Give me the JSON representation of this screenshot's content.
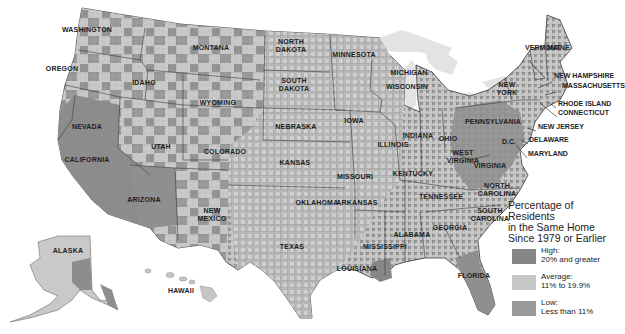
{
  "map": {
    "title": "Percentage of Residents in the Same Home Since 1979 or Earlier",
    "colors": {
      "high": "#8a8a8a",
      "average": "#c9c9c9",
      "low": "#9b9b9b",
      "border": "#3a3a3a",
      "water": "#e4e4e4",
      "background": "#ffffff"
    },
    "states": [
      {
        "name": "WASHINGTON",
        "x": 87,
        "y": 30
      },
      {
        "name": "OREGON",
        "x": 62,
        "y": 69
      },
      {
        "name": "IDAHO",
        "x": 144,
        "y": 83
      },
      {
        "name": "MONTANA",
        "x": 211,
        "y": 48
      },
      {
        "name": "WYOMING",
        "x": 218,
        "y": 103
      },
      {
        "name": "NORTH\nDAKOTA",
        "x": 291,
        "y": 46
      },
      {
        "name": "SOUTH\nDAKOTA",
        "x": 294,
        "y": 85
      },
      {
        "name": "MINNESOTA",
        "x": 354,
        "y": 55
      },
      {
        "name": "WISCONSIN",
        "x": 407,
        "y": 87
      },
      {
        "name": "MICHIGAN",
        "x": 409,
        "y": 73
      },
      {
        "name": "NEBRASKA",
        "x": 296,
        "y": 127
      },
      {
        "name": "IOWA",
        "x": 354,
        "y": 121
      },
      {
        "name": "ILLINOIS",
        "x": 393,
        "y": 145
      },
      {
        "name": "INDIANA",
        "x": 418,
        "y": 136
      },
      {
        "name": "OHIO",
        "x": 448,
        "y": 139
      },
      {
        "name": "NEVADA",
        "x": 87,
        "y": 127
      },
      {
        "name": "UTAH",
        "x": 161,
        "y": 147
      },
      {
        "name": "COLORADO",
        "x": 225,
        "y": 152
      },
      {
        "name": "KANSAS",
        "x": 295,
        "y": 163
      },
      {
        "name": "MISSOURI",
        "x": 355,
        "y": 177
      },
      {
        "name": "KENTUCKY",
        "x": 413,
        "y": 174
      },
      {
        "name": "WEST\nVIRGINIA",
        "x": 463,
        "y": 157
      },
      {
        "name": "VIRGINIA",
        "x": 490,
        "y": 166
      },
      {
        "name": "PENNSYLVANIA",
        "x": 493,
        "y": 122
      },
      {
        "name": "NEW\nYORK",
        "x": 507,
        "y": 89
      },
      {
        "name": "CALIFORNIA",
        "x": 87,
        "y": 160
      },
      {
        "name": "ARIZONA",
        "x": 144,
        "y": 200
      },
      {
        "name": "NEW\nMEXICO",
        "x": 212,
        "y": 215
      },
      {
        "name": "OKLAHOMA",
        "x": 317,
        "y": 203
      },
      {
        "name": "ARKANSAS",
        "x": 357,
        "y": 203
      },
      {
        "name": "TENNESSEE",
        "x": 441,
        "y": 197
      },
      {
        "name": "NORTH\nCAROLINA",
        "x": 497,
        "y": 190
      },
      {
        "name": "SOUTH\nCAROLINA",
        "x": 490,
        "y": 215
      },
      {
        "name": "GEORGIA",
        "x": 450,
        "y": 228
      },
      {
        "name": "ALABAMA",
        "x": 412,
        "y": 235
      },
      {
        "name": "MISSISSIPPI",
        "x": 385,
        "y": 247
      },
      {
        "name": "LOUISIANA",
        "x": 357,
        "y": 269
      },
      {
        "name": "TEXAS",
        "x": 292,
        "y": 247
      },
      {
        "name": "FLORIDA",
        "x": 474,
        "y": 276
      },
      {
        "name": "ALASKA",
        "x": 68,
        "y": 251
      },
      {
        "name": "HAWAII",
        "x": 181,
        "y": 291
      }
    ],
    "callouts": [
      {
        "name": "VERMONT",
        "x": 525,
        "y": 48
      },
      {
        "name": "MAINE",
        "x": 547,
        "y": 48
      },
      {
        "name": "NEW HAMPSHIRE",
        "x": 554,
        "y": 76
      },
      {
        "name": "MASSACHUSETTS",
        "x": 562,
        "y": 86
      },
      {
        "name": "RHODE ISLAND",
        "x": 558,
        "y": 104
      },
      {
        "name": "CONNECTICUT",
        "x": 558,
        "y": 113
      },
      {
        "name": "NEW JERSEY",
        "x": 538,
        "y": 127
      },
      {
        "name": "DELAWARE",
        "x": 529,
        "y": 140
      },
      {
        "name": "MARYLAND",
        "x": 528,
        "y": 154
      },
      {
        "name": "D.C.",
        "x": 502,
        "y": 142
      }
    ]
  },
  "legend": {
    "title": "Percentage of Residents in the Same Home Since 1979 or Earlier",
    "title_lines": [
      "Percentage of Residents",
      "in the Same Home",
      "Since 1979 or Earlier"
    ],
    "items": [
      {
        "label": "High:",
        "range": "20% and greater",
        "color": "#858585"
      },
      {
        "label": "Average:",
        "range": "11% to 19.9%",
        "color": "#c6c6c6"
      },
      {
        "label": "Low:",
        "range": "Less than 11%",
        "color": "#9a9a9a"
      }
    ]
  }
}
